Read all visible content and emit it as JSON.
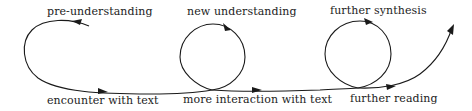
{
  "diagram": {
    "type": "hermeneutic-spiral",
    "stroke_color": "#1a1a1a",
    "text_color": "#222222",
    "top_labels": [
      {
        "text": "pre-understanding",
        "x": 47,
        "y": 6
      },
      {
        "text": "new understanding",
        "x": 187,
        "y": 6
      },
      {
        "text": "further synthesis",
        "x": 330,
        "y": 5
      }
    ],
    "bottom_labels": [
      {
        "text": "encounter with text",
        "x": 47,
        "y": 95
      },
      {
        "text": "more interaction with text",
        "x": 183,
        "y": 94
      },
      {
        "text": "further reading",
        "x": 350,
        "y": 93
      }
    ],
    "flow": [
      "pre-understanding",
      "encounter with text",
      "new understanding",
      "more interaction with text",
      "further synthesis",
      "further reading"
    ]
  }
}
